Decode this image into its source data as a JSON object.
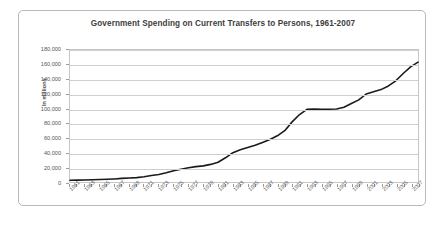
{
  "chart_data": {
    "type": "line",
    "title": "Government Spending on Current Transfers to Persons, 1961-2007",
    "xlabel": "",
    "ylabel": "In millions",
    "ylim": [
      0,
      180000
    ],
    "xlim": [
      1961,
      2008
    ],
    "grid": true,
    "legend": false,
    "y_ticks": [
      "180,000",
      "160,000",
      "140,000",
      "120,000",
      "100,000",
      "80,000",
      "60,000",
      "40,000",
      "20,000",
      "0"
    ],
    "y_tick_values": [
      180000,
      160000,
      140000,
      120000,
      100000,
      80000,
      60000,
      40000,
      20000,
      0
    ],
    "x_tick_labels": [
      "1961",
      "1963",
      "1965",
      "1967",
      "1969",
      "1971",
      "1973",
      "1975",
      "1977",
      "1979",
      "1981",
      "1983",
      "1985",
      "1987",
      "1989",
      "1991",
      "1993",
      "1995",
      "1997",
      "1999",
      "2001",
      "2003",
      "2005",
      "2007"
    ],
    "series": [
      {
        "name": "Current Transfers to Persons",
        "color": "#1a1a1a",
        "x": [
          1961,
          1962,
          1963,
          1964,
          1965,
          1966,
          1967,
          1968,
          1969,
          1970,
          1971,
          1972,
          1973,
          1974,
          1975,
          1976,
          1977,
          1978,
          1979,
          1980,
          1981,
          1982,
          1983,
          1984,
          1985,
          1986,
          1987,
          1988,
          1989,
          1990,
          1991,
          1992,
          1993,
          1994,
          1995,
          1996,
          1997,
          1998,
          1999,
          2000,
          2001,
          2002,
          2003,
          2004,
          2005,
          2006,
          2007,
          2008
        ],
        "values": [
          2400,
          2600,
          2800,
          3000,
          3300,
          3700,
          4200,
          4900,
          5400,
          6000,
          7200,
          8800,
          10200,
          12500,
          15500,
          17500,
          19500,
          21000,
          22000,
          24000,
          27000,
          33000,
          40000,
          44000,
          47000,
          50000,
          54000,
          58000,
          63000,
          70000,
          82000,
          92000,
          99000,
          99500,
          99000,
          99200,
          99500,
          102000,
          107000,
          112000,
          120000,
          123000,
          126000,
          131000,
          138000,
          148000,
          157000,
          163500
        ]
      }
    ]
  }
}
